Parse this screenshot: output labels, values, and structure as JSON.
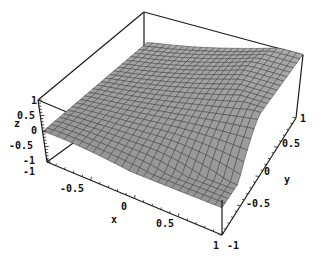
{
  "chart_data": {
    "type": "surface3d",
    "title": "",
    "xlabel": "x",
    "ylabel": "y",
    "zlabel": "z",
    "x_range": [
      -1,
      1
    ],
    "y_range": [
      -1,
      1
    ],
    "z_range": [
      -1,
      1
    ],
    "x_ticks": [
      "-1",
      "-0.5",
      "0",
      "0.5",
      "1"
    ],
    "y_ticks": [
      "-1",
      "-0.5",
      "0",
      "0.5",
      "1"
    ],
    "z_ticks": [
      "1",
      "0.5",
      "0",
      "-0.5",
      "-1"
    ],
    "grid_resolution": 25,
    "surface_color": "#a8a8a8",
    "mesh_color": "#3a3a3a",
    "box": true
  },
  "axes": {
    "x": {
      "label": "x",
      "ticks": [
        {
          "text": "-1",
          "x": 22,
          "y": 180
        },
        {
          "text": "-0.5",
          "x": 62,
          "y": 192
        },
        {
          "text": "0",
          "x": 124,
          "y": 210
        },
        {
          "text": "0.5",
          "x": 181,
          "y": 228
        },
        {
          "text": "1",
          "x": 216,
          "y": 250
        }
      ],
      "label_pos": {
        "x": 111,
        "y": 226
      }
    },
    "y": {
      "label": "y",
      "ticks": [
        {
          "text": "-1",
          "x": 229,
          "y": 249
        },
        {
          "text": "-0.5",
          "x": 247,
          "y": 208
        },
        {
          "text": "0",
          "x": 265,
          "y": 176
        },
        {
          "text": "0.5",
          "x": 283,
          "y": 148
        },
        {
          "text": "1",
          "x": 300,
          "y": 122
        }
      ],
      "label_pos": {
        "x": 283,
        "y": 182
      }
    },
    "z": {
      "label": "z",
      "ticks": [
        {
          "text": "1",
          "x": 33,
          "y": 103
        },
        {
          "text": "0.5",
          "x": 19,
          "y": 118
        },
        {
          "text": "0",
          "x": 27,
          "y": 132
        },
        {
          "text": "-0.5",
          "x": 13,
          "y": 148
        },
        {
          "text": "-1",
          "x": 27,
          "y": 161
        }
      ],
      "label_pos": {
        "x": 16,
        "y": 126
      }
    }
  }
}
